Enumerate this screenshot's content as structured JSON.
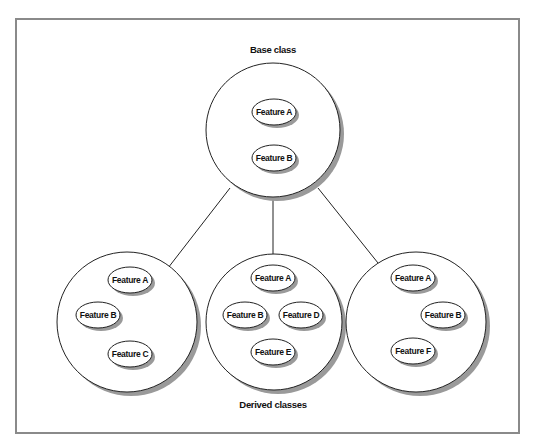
{
  "diagram": {
    "title_top": "Base class",
    "title_bottom": "Derived classes",
    "base_class": {
      "features": [
        "Feature A",
        "Feature B"
      ]
    },
    "derived_classes": [
      {
        "features": [
          "Feature A",
          "Feature B",
          "Feature C"
        ]
      },
      {
        "features": [
          "Feature A",
          "Feature B",
          "Feature D",
          "Feature E"
        ]
      },
      {
        "features": [
          "Feature A",
          "Feature B",
          "Feature F"
        ]
      }
    ],
    "colors": {
      "stroke": "#222222",
      "shadow": "#9a9a9a",
      "frame": "#8a8a8a",
      "fill": "#ffffff"
    }
  }
}
